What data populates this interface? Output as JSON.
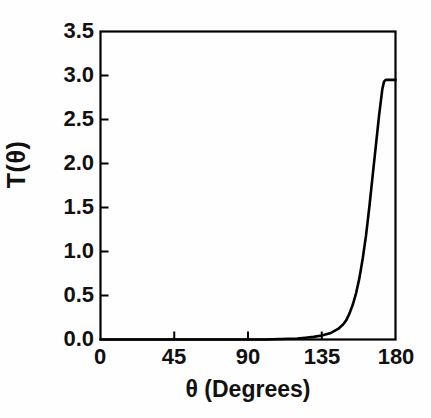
{
  "chart_data": {
    "type": "line",
    "title": "",
    "xlabel": "θ (Degrees)",
    "ylabel": "T(θ)",
    "xlim": [
      0,
      180
    ],
    "ylim": [
      0.0,
      3.5
    ],
    "xticks": [
      0,
      45,
      90,
      135,
      180
    ],
    "xtick_labels": [
      "0",
      "45",
      "90",
      "135",
      "180"
    ],
    "yticks": [
      0.0,
      0.5,
      1.0,
      1.5,
      2.0,
      2.5,
      3.0,
      3.5
    ],
    "ytick_labels": [
      "0.0",
      "0.5",
      "1.0",
      "1.5",
      "2.0",
      "2.5",
      "3.0",
      "3.5"
    ],
    "grid": false,
    "legend": null,
    "line_color": "#000000",
    "line_width": 2.6,
    "series": [
      {
        "name": "T(θ)",
        "x": [
          0,
          10,
          20,
          30,
          40,
          50,
          60,
          70,
          80,
          90,
          100,
          110,
          120,
          125,
          130,
          135,
          140,
          145,
          148,
          150,
          152,
          154,
          156,
          158,
          160,
          162,
          164,
          166,
          168,
          170,
          172,
          173,
          174,
          174.5,
          175,
          176,
          178,
          180
        ],
        "y": [
          0.0,
          0.0,
          0.0,
          0.0,
          0.0,
          0.0,
          0.0,
          0.0,
          0.0,
          0.0,
          0.0,
          0.005,
          0.012,
          0.02,
          0.03,
          0.045,
          0.07,
          0.12,
          0.17,
          0.22,
          0.3,
          0.4,
          0.53,
          0.7,
          0.92,
          1.18,
          1.5,
          1.85,
          2.2,
          2.55,
          2.85,
          2.93,
          2.95,
          2.95,
          2.95,
          2.95,
          2.95,
          2.95
        ]
      }
    ],
    "annotations": [
      {
        "text": "curve is flat near zero from 0° to about 140°"
      },
      {
        "text": "steep exponential rise between 140° and 174°"
      },
      {
        "text": "plateau at about 2.95 from 174° to 180°"
      }
    ],
    "peak_value": 2.95
  },
  "axes": {
    "frame_color": "#000000",
    "frame_width": 2.2,
    "tick_direction": "in",
    "tick_length": 8
  }
}
